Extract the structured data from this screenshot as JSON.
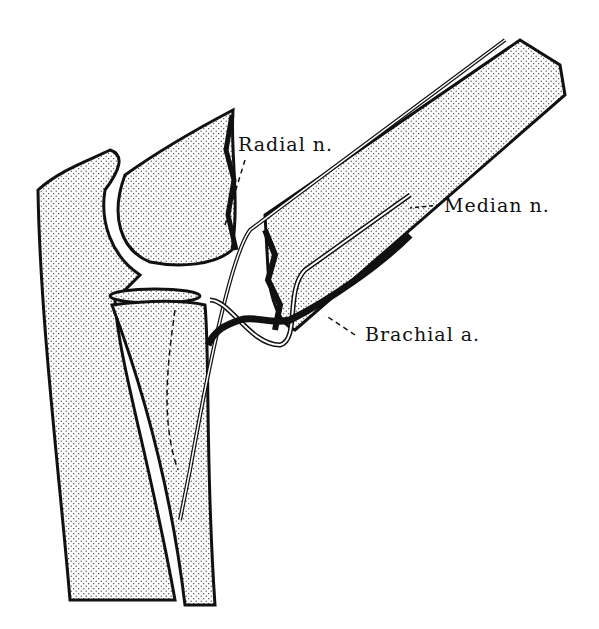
{
  "diagram": {
    "labels": {
      "radial": "Radial n.",
      "median": "Median n.",
      "brachial": "Brachial a."
    },
    "colors": {
      "ink": "#111111",
      "background": "#ffffff"
    }
  }
}
